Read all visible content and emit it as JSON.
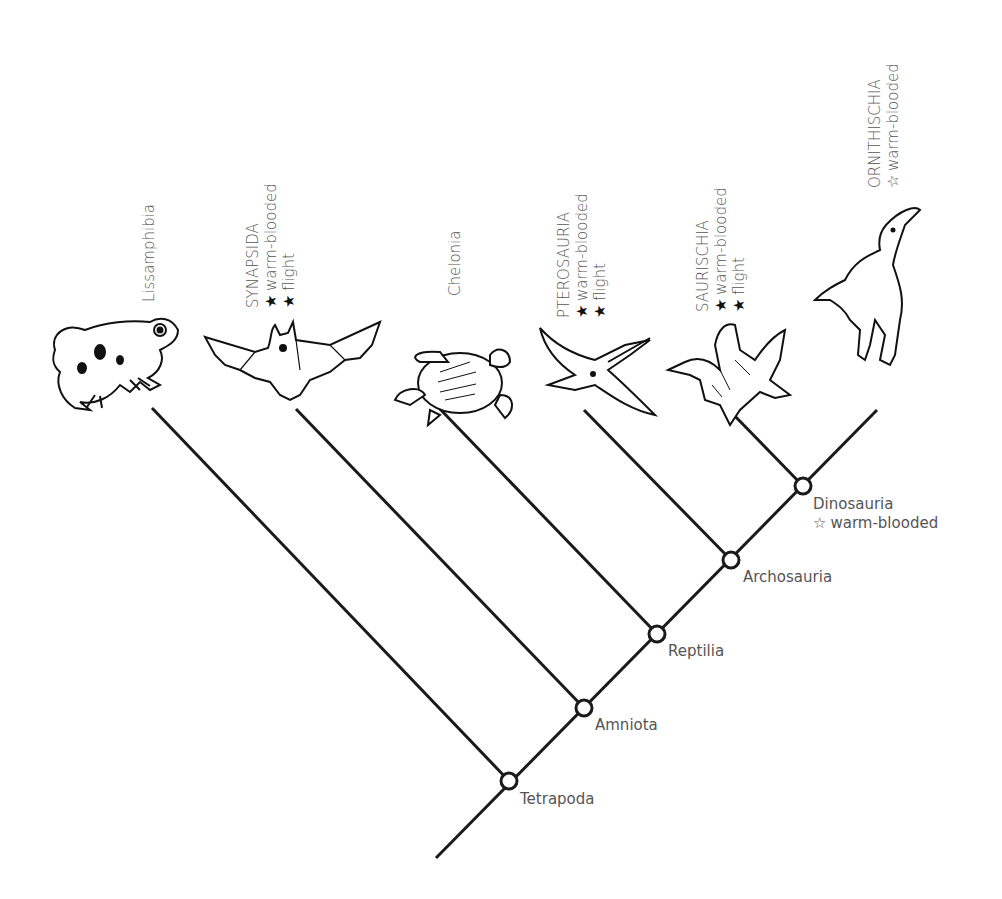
{
  "tree": {
    "stroke_color": "#1a1a1a",
    "root": {
      "x": 436,
      "y": 858
    },
    "spine_end": {
      "x": 877,
      "y": 410
    },
    "nodes": [
      {
        "id": "tetrapoda",
        "label": "Tetrapoda",
        "x": 509,
        "y": 781
      },
      {
        "id": "amniota",
        "label": "Amniota",
        "x": 584,
        "y": 708
      },
      {
        "id": "reptilia",
        "label": "Reptilia",
        "x": 657,
        "y": 634
      },
      {
        "id": "archosauria",
        "label": "Archosauria",
        "x": 731,
        "y": 560
      },
      {
        "id": "dinosauria",
        "label": "Dinosauria",
        "x": 803,
        "y": 486,
        "trait": "warm-blooded",
        "trait_symbol": "☆"
      }
    ],
    "leaves": [
      {
        "id": "lissamphibia",
        "name": "Lissamphibia",
        "animal": "frog-illustration",
        "tip": {
          "x": 152,
          "y": 408
        },
        "traits": []
      },
      {
        "id": "synapsida",
        "name": "SYNAPSIDA",
        "animal": "bat-illustration",
        "tip": {
          "x": 296,
          "y": 409
        },
        "traits": [
          {
            "symbol": "★",
            "text": "warm-blooded"
          },
          {
            "symbol": "★",
            "text": "flight"
          }
        ]
      },
      {
        "id": "chelonia",
        "name": "Chelonia",
        "animal": "sea-turtle-illustration",
        "tip": {
          "x": 440,
          "y": 409
        },
        "traits": []
      },
      {
        "id": "pterosauria",
        "name": "PTEROSAURIA",
        "animal": "pterosaur-illustration",
        "tip": {
          "x": 584,
          "y": 410
        },
        "traits": [
          {
            "symbol": "★",
            "text": "warm-blooded"
          },
          {
            "symbol": "★",
            "text": "flight"
          }
        ]
      },
      {
        "id": "saurischia",
        "name": "SAURISCHIA",
        "animal": "feathered-dinosaur-illustration",
        "tip": {
          "x": 729,
          "y": 410
        },
        "traits": [
          {
            "symbol": "★",
            "text": "warm-blooded"
          },
          {
            "symbol": "★",
            "text": "flight"
          }
        ]
      },
      {
        "id": "ornithischia",
        "name": "ORNITHISCHIA",
        "animal": "parasaurolophus-illustration",
        "tip": null,
        "traits": [
          {
            "symbol": "☆",
            "text": "warm-blooded"
          }
        ]
      }
    ]
  },
  "labels": {
    "lissamphibia": "Lissamphibia",
    "synapsida": {
      "name": "SYNAPSIDA",
      "t1": "warm-blooded",
      "t2": "flight",
      "s1": "★",
      "s2": "★"
    },
    "chelonia": "Chelonia",
    "pterosauria": {
      "name": "PTEROSAURIA",
      "t1": "warm-blooded",
      "t2": "flight",
      "s1": "★",
      "s2": "★"
    },
    "saurischia": {
      "name": "SAURISCHIA",
      "t1": "warm-blooded",
      "t2": "flight",
      "s1": "★",
      "s2": "★"
    },
    "ornithischia": {
      "name": "ORNITHISCHIA",
      "t1": "warm-blooded",
      "s1": "☆"
    },
    "tetrapoda": "Tetrapoda",
    "amniota": "Amniota",
    "reptilia": "Reptilia",
    "archosauria": "Archosauria",
    "dinosauria": {
      "name": "Dinosauria",
      "t1": "warm-blooded",
      "s1": "☆"
    }
  }
}
